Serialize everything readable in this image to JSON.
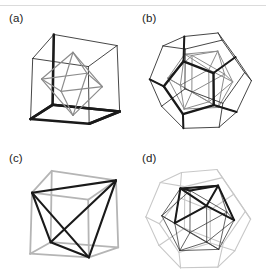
{
  "figure": {
    "background_color": "#ffffff",
    "width": 266,
    "height": 280,
    "has_scan_artifact_line": true
  },
  "colors": {
    "black": "#1a1a1a",
    "dark": "#333333",
    "gray": "#8c8c8c",
    "light_gray": "#b5b5b5",
    "pale_gray": "#c8c8c8",
    "background": "#ffffff"
  },
  "panels": [
    {
      "id": "a",
      "label": "(a)",
      "outer_solid": "cube",
      "inner_solid": "octahedron",
      "outer_color": "#1a1a1a",
      "inner_color": "#8c8c8c",
      "description": "Octahedron inscribed in a cube; octahedron vertices at cube face centers"
    },
    {
      "id": "b",
      "label": "(b)",
      "outer_solid": "dodecahedron",
      "inner_solid": "icosahedron",
      "outer_color": "#1a1a1a",
      "inner_color": "#8c8c8c",
      "description": "Icosahedron inscribed in a dodecahedron; icosahedron vertices at dodecahedron face centers"
    },
    {
      "id": "c",
      "label": "(c)",
      "outer_solid": "cube",
      "inner_solid": "tetrahedron",
      "outer_color": "#8c8c8c",
      "inner_color": "#1a1a1a",
      "description": "Tetrahedron inscribed in a cube using four alternating cube vertices"
    },
    {
      "id": "d",
      "label": "(d)",
      "outer_solid": "dodecahedron",
      "inner_solid": "icosahedron",
      "outer_color": "#b5b5b5",
      "inner_color": "#1a1a1a",
      "description": "Icosahedron drawn dark inside a pale dodecahedron"
    }
  ],
  "chart_data": {
    "type": "diagram",
    "projection": "orthographic-perspective wireframe",
    "panel_grid": {
      "rows": 2,
      "cols": 2
    },
    "panel_ids": [
      "a",
      "b",
      "c",
      "d"
    ],
    "solids": {
      "cube": {
        "vertices": 8,
        "edges": 12,
        "faces": 6
      },
      "octahedron": {
        "vertices": 6,
        "edges": 12,
        "faces": 8
      },
      "tetrahedron": {
        "vertices": 4,
        "edges": 6,
        "faces": 4
      },
      "dodecahedron": {
        "vertices": 20,
        "edges": 30,
        "faces": 12
      },
      "icosahedron": {
        "vertices": 12,
        "edges": 30,
        "faces": 20
      }
    },
    "pairs": [
      {
        "panel": "a",
        "outer": "cube",
        "inner": "octahedron"
      },
      {
        "panel": "b",
        "outer": "dodecahedron",
        "inner": "icosahedron"
      },
      {
        "panel": "c",
        "outer": "cube",
        "inner": "tetrahedron"
      },
      {
        "panel": "d",
        "outer": "dodecahedron",
        "inner": "icosahedron"
      }
    ]
  }
}
